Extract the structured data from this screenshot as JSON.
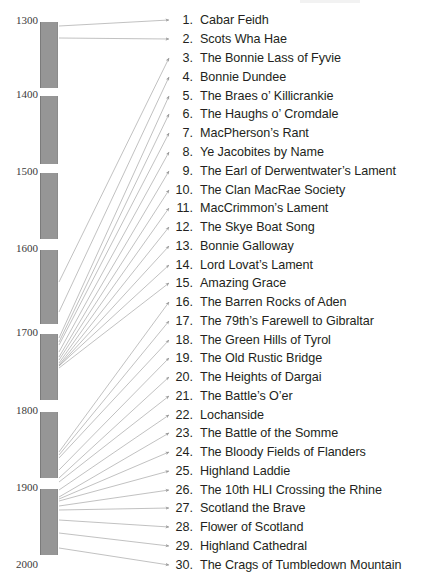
{
  "figure": {
    "width": 427,
    "height": 586,
    "bar_color": "#969696",
    "line_color": "#a6a6a6",
    "text_color": "#231f20"
  },
  "timeline": {
    "name": "century-axis",
    "orientation": "vertical",
    "labels": [
      {
        "text": "1300",
        "y": 20
      },
      {
        "text": "1400",
        "y": 94
      },
      {
        "text": "1500",
        "y": 171
      },
      {
        "text": "1600",
        "y": 248
      },
      {
        "text": "1700",
        "y": 332
      },
      {
        "text": "1800",
        "y": 410
      },
      {
        "text": "1900",
        "y": 487
      },
      {
        "text": "2000",
        "y": 564
      }
    ],
    "bars": [
      {
        "century": "1300s",
        "top": 22,
        "height": 66
      },
      {
        "century": "1400s",
        "top": 96,
        "height": 68
      },
      {
        "century": "1500s",
        "top": 173,
        "height": 66
      },
      {
        "century": "1600s",
        "top": 250,
        "height": 74
      },
      {
        "century": "1700s",
        "top": 334,
        "height": 66
      },
      {
        "century": "1800s",
        "top": 412,
        "height": 66
      },
      {
        "century": "1900s",
        "top": 489,
        "height": 66
      }
    ]
  },
  "songs": [
    {
      "num": "1.",
      "title": "Cabar Feidh",
      "y": 20,
      "origin_y": 26
    },
    {
      "num": "2.",
      "title": "Scots Wha Hae",
      "y": 39,
      "origin_y": 38
    },
    {
      "num": "3.",
      "title": "The Bonnie Lass of Fyvie",
      "y": 58,
      "origin_y": 282
    },
    {
      "num": "4.",
      "title": "Bonnie Dundee",
      "y": 77,
      "origin_y": 312
    },
    {
      "num": "5.",
      "title": "The Braes o’ Killicrankie",
      "y": 96,
      "origin_y": 338
    },
    {
      "num": "6.",
      "title": "The Haughs o’ Cromdale",
      "y": 114,
      "origin_y": 342
    },
    {
      "num": "7.",
      "title": "MacPherson’s Rant",
      "y": 133,
      "origin_y": 345
    },
    {
      "num": "8.",
      "title": "Ye Jacobites by Name",
      "y": 152,
      "origin_y": 352
    },
    {
      "num": "9.",
      "title": "The Earl of Derwentwater’s Lament",
      "y": 171,
      "origin_y": 357
    },
    {
      "num": "10.",
      "title": "The Clan MacRae Society",
      "y": 190,
      "origin_y": 360
    },
    {
      "num": "11.",
      "title": "MacCrimmon’s Lament",
      "y": 208,
      "origin_y": 363
    },
    {
      "num": "12.",
      "title": "The Skye Boat Song",
      "y": 227,
      "origin_y": 365
    },
    {
      "num": "13.",
      "title": "Bonnie Galloway",
      "y": 246,
      "origin_y": 366
    },
    {
      "num": "14.",
      "title": "Lord Lovat’s Lament",
      "y": 265,
      "origin_y": 366
    },
    {
      "num": "15.",
      "title": "Amazing Grace",
      "y": 283,
      "origin_y": 368
    },
    {
      "num": "16.",
      "title": "The Barren Rocks of Aden",
      "y": 302,
      "origin_y": 452
    },
    {
      "num": "17.",
      "title": "The 79th’s Farewell to Gibraltar",
      "y": 321,
      "origin_y": 455
    },
    {
      "num": "18.",
      "title": "The Green Hills of Tyrol",
      "y": 340,
      "origin_y": 458
    },
    {
      "num": "19.",
      "title": "The Old Rustic Bridge",
      "y": 358,
      "origin_y": 470
    },
    {
      "num": "20.",
      "title": "The Heights of Dargai",
      "y": 377,
      "origin_y": 478
    },
    {
      "num": "21.",
      "title": "The Battle’s O’er",
      "y": 396,
      "origin_y": 482
    },
    {
      "num": "22.",
      "title": "Lochanside",
      "y": 415,
      "origin_y": 490
    },
    {
      "num": "23.",
      "title": "The Battle of the Somme",
      "y": 433,
      "origin_y": 497
    },
    {
      "num": "24.",
      "title": "The Bloody Fields of Flanders",
      "y": 452,
      "origin_y": 499
    },
    {
      "num": "25.",
      "title": "Highland Laddie",
      "y": 471,
      "origin_y": 501
    },
    {
      "num": "26.",
      "title": "The 10th HLI Crossing the Rhine",
      "y": 490,
      "origin_y": 506
    },
    {
      "num": "27.",
      "title": "Scotland the Brave",
      "y": 508,
      "origin_y": 510
    },
    {
      "num": "28.",
      "title": "Flower of Scotland",
      "y": 527,
      "origin_y": 520
    },
    {
      "num": "29.",
      "title": "Highland Cathedral",
      "y": 546,
      "origin_y": 533
    },
    {
      "num": "30.",
      "title": "The Crags of Tumbledown Mountain",
      "y": 565,
      "origin_y": 548
    }
  ]
}
